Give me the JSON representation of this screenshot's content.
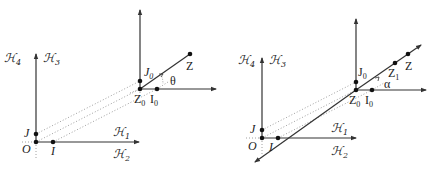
{
  "figures": [
    {
      "id": "left",
      "labels": {
        "H4": "ℋ",
        "H4_sub": "4",
        "H3": "ℋ",
        "H3_sub": "3",
        "H1": "ℋ",
        "H1_sub": "1",
        "H2": "ℋ",
        "H2_sub": "2",
        "J": "J",
        "O": "O",
        "I": "I",
        "J0": "J",
        "J0_sub": "0",
        "Z0": "Z",
        "Z0_sub": "0",
        "I0": "I",
        "I0_sub": "0",
        "Z": "Z",
        "angle": "θ"
      }
    },
    {
      "id": "right",
      "labels": {
        "H4": "ℋ",
        "H4_sub": "4",
        "H3": "ℋ",
        "H3_sub": "3",
        "H1": "ℋ",
        "H1_sub": "1",
        "H2": "ℋ",
        "H2_sub": "2",
        "J": "J",
        "O": "O",
        "I": "I",
        "J0": "J",
        "J0_sub": "0",
        "Z0": "Z",
        "Z0_sub": "0",
        "I0": "I",
        "I0_sub": "0",
        "Z1": "Z",
        "Z1_sub": "1",
        "Z": "Z",
        "angle": "α"
      }
    }
  ],
  "colors": {
    "stroke": "#333333",
    "dot": "#111111",
    "dotted": "#888888"
  }
}
